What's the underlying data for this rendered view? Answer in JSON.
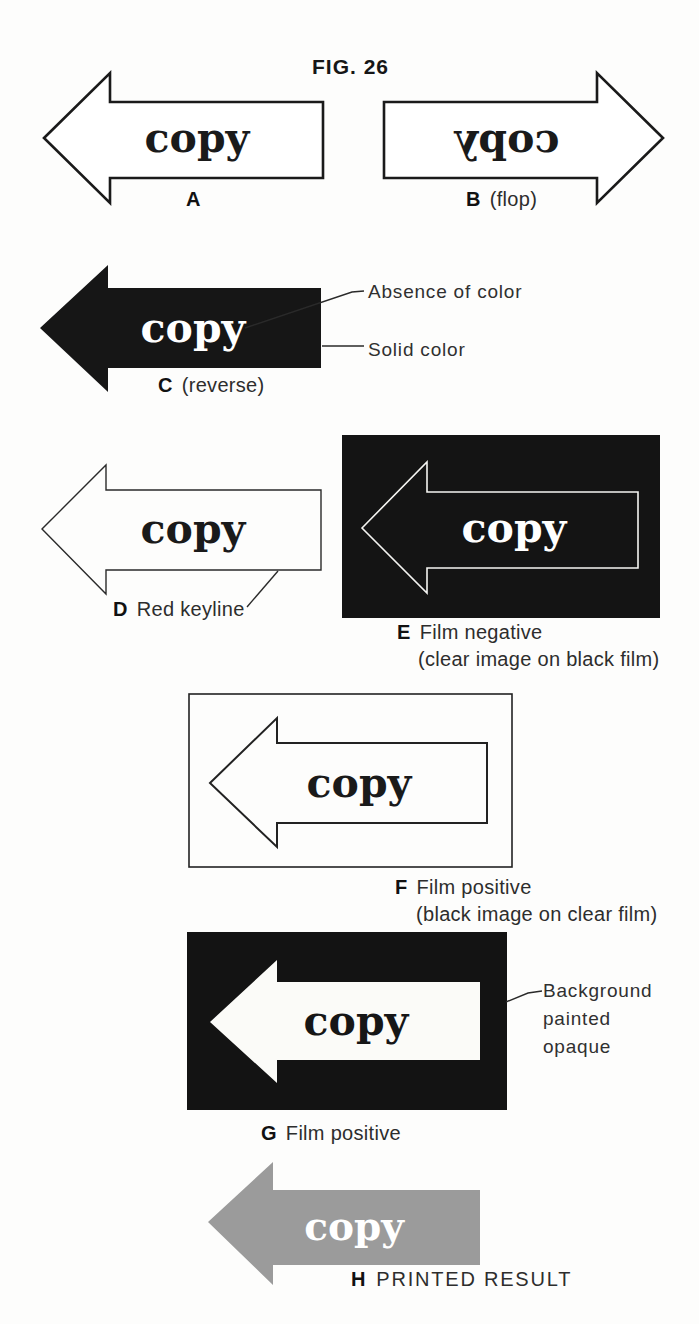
{
  "figure_title": "FIG. 26",
  "arrow_word": "copy",
  "colors": {
    "ink": "#1a1a1a",
    "panel_black": "#141414",
    "printed_gray": "#9b9b9b",
    "page_bg": "#fdfdfc"
  },
  "sections": {
    "a": {
      "letter": "A",
      "caption": ""
    },
    "b": {
      "letter": "B",
      "caption": "(flop)"
    },
    "c": {
      "letter": "C",
      "caption": "(reverse)"
    },
    "d": {
      "letter": "D",
      "caption": "Red keyline"
    },
    "e": {
      "letter": "E",
      "caption": "Film negative",
      "subcaption": "(clear image on black film)"
    },
    "f": {
      "letter": "F",
      "caption": "Film positive",
      "subcaption": "(black image on clear film)"
    },
    "g": {
      "letter": "G",
      "caption": "Film positive"
    },
    "h": {
      "letter": "H",
      "caption": "PRINTED RESULT"
    }
  },
  "annotations": {
    "absence_of_color": "Absence of color",
    "solid_color": "Solid color",
    "background_opaque": "Background\npainted\nopaque"
  }
}
